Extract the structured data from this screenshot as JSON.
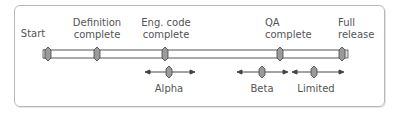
{
  "diagram": {
    "type": "release-timeline",
    "milestones": [
      {
        "id": "start",
        "line1": "",
        "line2": "Start",
        "x": 48
      },
      {
        "id": "definition",
        "line1": "Definition",
        "line2": "complete",
        "x": 97
      },
      {
        "id": "eng-code",
        "line1": "Eng. code",
        "line2": "complete",
        "x": 165
      },
      {
        "id": "qa",
        "line1": "QA",
        "line2": "complete",
        "x": 280
      },
      {
        "id": "full-release",
        "line1": "Full",
        "line2": "release",
        "x": 342
      }
    ],
    "phases": [
      {
        "id": "alpha",
        "label": "Alpha",
        "x": 169,
        "from": 145,
        "to": 195
      },
      {
        "id": "beta",
        "label": "Beta",
        "x": 262,
        "from": 237,
        "to": 288
      },
      {
        "id": "limited",
        "label": "Limited",
        "x": 314,
        "from": 292,
        "to": 344
      }
    ],
    "colors": {
      "frame": "#b8b8b8",
      "bar_outline": "#555555",
      "marker_fill": "#9a9a9a",
      "text": "#555555"
    }
  }
}
